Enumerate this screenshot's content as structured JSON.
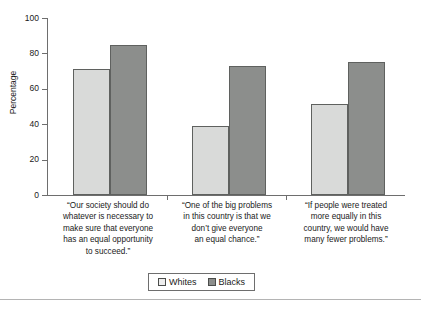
{
  "chart_data": {
    "type": "bar",
    "title": "",
    "subtitle": "",
    "xlabel": "",
    "ylabel": "Percentage",
    "ylim": [
      0,
      100
    ],
    "yticks": [
      0,
      20,
      40,
      60,
      80,
      100
    ],
    "ytick_labels": [
      "0",
      "20",
      "40",
      "60",
      "80",
      "100"
    ],
    "grid": false,
    "legend_position": "bottom-center",
    "categories": [
      "“Our society should do whatever is necessary to make sure that everyone has an equal opportunity to succeed.”",
      "“One of the big problems in this country is that we don’t give everyone an equal chance.”",
      "“If people were treated more equally in this country, we would have many fewer problems.”"
    ],
    "category_lines": [
      [
        "“Our society should do",
        "whatever is necessary to",
        "make sure that everyone",
        "has an equal opportunity",
        "to succeed.”"
      ],
      [
        "“One of the big problems",
        "in this country is that we",
        "don’t give everyone",
        "an equal chance.”"
      ],
      [
        "“If people were treated",
        "more equally in this",
        "country, we would have",
        "many fewer problems.”"
      ]
    ],
    "series": [
      {
        "name": "Whites",
        "color": "#d9dad9",
        "values": [
          71,
          39,
          51.5
        ]
      },
      {
        "name": "Blacks",
        "color": "#8c8e8c",
        "values": [
          85,
          73,
          75
        ]
      }
    ]
  },
  "legend": {
    "items": [
      {
        "label": "Whites"
      },
      {
        "label": "Blacks"
      }
    ]
  },
  "colors": {
    "whites_fill": "#d9dad9",
    "blacks_fill": "#8c8e8c",
    "bar_stroke": "#5f615f",
    "axis": "#6e6e6e",
    "text": "#1a1a1a",
    "rule": "#b4b4b4"
  }
}
